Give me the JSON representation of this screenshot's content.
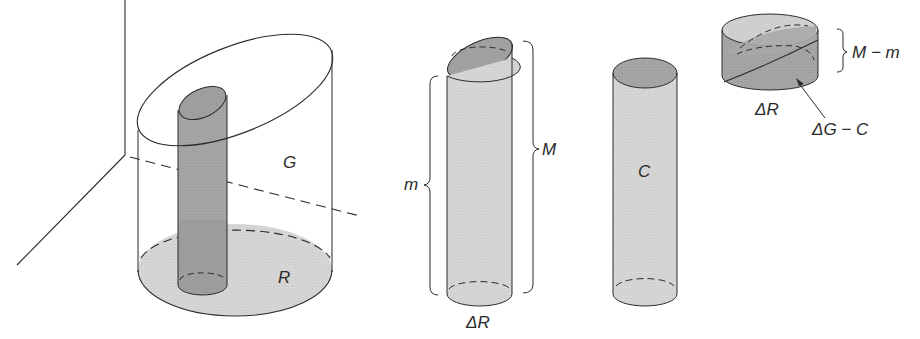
{
  "figure": {
    "colors": {
      "line": "#2b2b2b",
      "light_fill": "#d9d9d9",
      "mid_fill": "#c4c4c4",
      "dark_fill": "#9a9a9a",
      "background": "#ffffff"
    }
  },
  "labels": {
    "G": "G",
    "R": "R",
    "m": "m",
    "M": "M",
    "delta_R_middle": "ΔR",
    "C": "C",
    "M_minus_m": "M − m",
    "delta_R_small": "ΔR",
    "delta_G_minus_C": "ΔG − C"
  },
  "parts": [
    {
      "id": "large-solid",
      "labels": [
        "G",
        "R"
      ],
      "desc": "Cylinder with slanted elliptical top over base disk R, containing thin column over ΔR"
    },
    {
      "id": "column-over-delta-R",
      "labels": [
        "m",
        "M",
        "ΔR"
      ],
      "desc": "Thin column with slanted top; min height m, max height M"
    },
    {
      "id": "cylinder-C",
      "labels": [
        "C"
      ],
      "desc": "Flat-topped cylinder of height m"
    },
    {
      "id": "wedge-piece",
      "labels": [
        "M − m",
        "ΔR",
        "ΔG − C"
      ],
      "desc": "Remaining wedge of height M − m"
    }
  ]
}
